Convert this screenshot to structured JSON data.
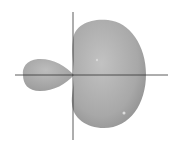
{
  "diagram": {
    "colors": {
      "background": "#ffffff",
      "lobe_fill": "#a9a9a9",
      "lobe_highlight": "#c4c4c4",
      "lobe_shadow": "#8e8e8e",
      "axis": "#333333"
    },
    "axes": {
      "vertical": {
        "x": 73,
        "y1": 12,
        "y2": 140
      },
      "horizontal": {
        "y": 75,
        "x1": 15,
        "x2": 168
      }
    },
    "lobes": [
      {
        "name": "large-lobe",
        "cx": 110,
        "cy": 74,
        "rx": 37,
        "ry": 54
      },
      {
        "name": "small-lobe",
        "cx": 44,
        "cy": 74,
        "rx": 21,
        "ry": 16
      }
    ]
  }
}
